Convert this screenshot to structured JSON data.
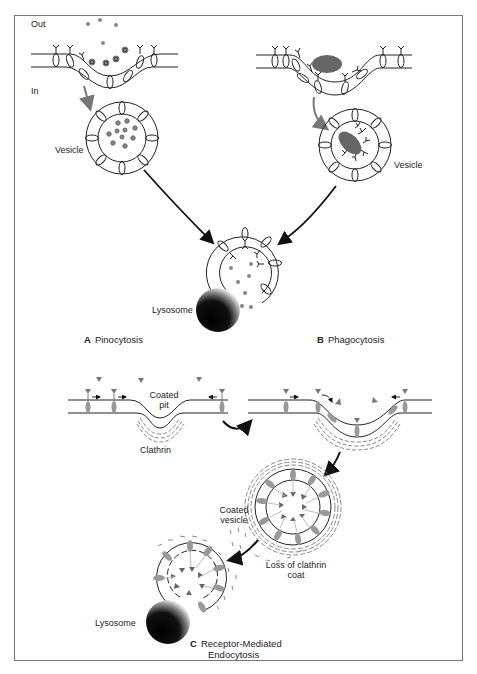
{
  "figure": {
    "frame_color": "#777777",
    "line_color": "#222222",
    "protein_gray": "#8a8a8a",
    "panels": {
      "A": {
        "letter": "A",
        "title": "Pinocytosis"
      },
      "B": {
        "letter": "B",
        "title": "Phagocytosis"
      },
      "C": {
        "letter": "C",
        "title_line1": "Receptor-Mediated",
        "title_line2": "Endocytosis"
      }
    },
    "labels": {
      "out": "Out",
      "in": "In",
      "vesicle_a": "Vesicle",
      "vesicle_b": "Vesicle",
      "lysosome_ab": "Lysosome",
      "coated_pit_1": "Coated",
      "coated_pit_2": "pit",
      "clathrin": "Clathrin",
      "coated_vesicle_1": "Coated",
      "coated_vesicle_2": "vesicle",
      "loss_coat_1": "Loss of clathrin",
      "loss_coat_2": "coat",
      "lysosome_c": "Lysosome"
    }
  }
}
